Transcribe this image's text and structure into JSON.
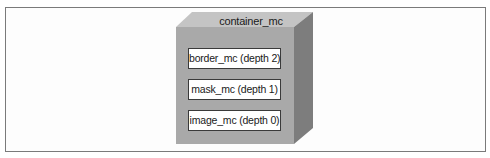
{
  "diagram": {
    "container": {
      "label": "container_mc"
    },
    "layers": [
      {
        "label": "border_mc (depth 2)",
        "depth": 2
      },
      {
        "label": "mask_mc (depth 1)",
        "depth": 1
      },
      {
        "label": "image_mc (depth 0)",
        "depth": 0
      }
    ],
    "colors": {
      "front_face": "#a9a9a9",
      "top_face": "#c4c4c4",
      "side_face": "#7d7d7d",
      "layer_box_fill": "#ffffff",
      "layer_box_border": "#3a3a3a",
      "frame_border": "#7a7a7a"
    }
  }
}
